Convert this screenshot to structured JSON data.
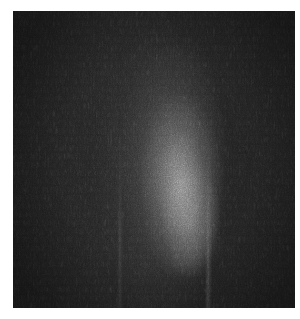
{
  "image": {
    "description": "Grayscale noisy micrograph with bright elongated vertical blob near center",
    "background_color": "#1e1e1e",
    "border_color": "#ffffff",
    "highlight_color": "#b4b4b4",
    "frame": {
      "left": 13,
      "top": 11,
      "width": 282,
      "height": 297
    }
  }
}
